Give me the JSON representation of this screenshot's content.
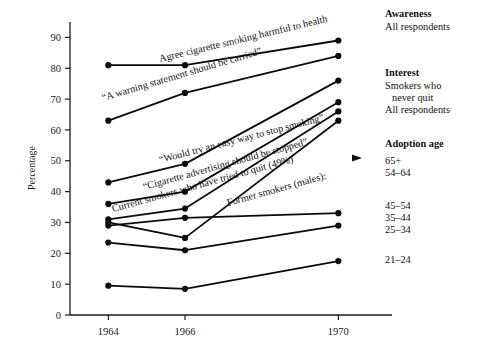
{
  "chart_data": {
    "type": "line",
    "title": "",
    "xlabel": "",
    "ylabel": "Percentage",
    "x": [
      1964,
      1966,
      1970
    ],
    "xtick_labels": [
      "1964",
      "1966",
      "1970"
    ],
    "ylim": [
      0,
      95
    ],
    "yticks": [
      0,
      10,
      20,
      30,
      40,
      50,
      60,
      70,
      80,
      90
    ],
    "ytick_labels": [
      "0",
      "10",
      "20",
      "30",
      "40",
      "50",
      "60",
      "70",
      "80",
      "90"
    ],
    "grid": false,
    "legend_position": "right",
    "marker": "filled-circle",
    "series": [
      {
        "name": "Awareness - All respondents",
        "label": "Agree cigarette smoking harmful to health",
        "values": [
          81,
          81,
          89
        ]
      },
      {
        "name": "Interest - Smokers who never quit",
        "label": "“A warning statement should be carried”",
        "values": [
          63,
          72,
          84
        ]
      },
      {
        "name": "Interest - All respondents",
        "label": "“Would try an easy way to stop smoking”",
        "values": [
          43,
          49,
          76
        ]
      },
      {
        "name": "Adoption age 65+",
        "label": "“Cigarette advertising should be stopped”",
        "values": [
          36,
          40,
          69
        ]
      },
      {
        "name": "Adoption age 54-64",
        "label": "Current smokers who have tried to quit (49%)",
        "values": [
          31,
          34.5,
          66
        ]
      },
      {
        "name": "Adoption age 45-54",
        "label": "Former smokers (males):",
        "values": [
          30,
          25,
          63
        ]
      },
      {
        "name": "Adoption age 35-44",
        "label": "",
        "values": [
          29,
          31.5,
          33
        ]
      },
      {
        "name": "Adoption age 25-34",
        "label": "",
        "values": [
          23.5,
          21,
          29
        ]
      },
      {
        "name": "Adoption age 21-24",
        "label": "",
        "values": [
          9.5,
          8.5,
          17.5
        ]
      }
    ],
    "annotations": [
      {
        "text": "Agree cigarette smoking harmful to health"
      },
      {
        "text": "“A warning statement should be carried”"
      },
      {
        "text": "“Would try an easy way to stop smoking”"
      },
      {
        "text": "“Cigarette advertising should be stopped”"
      },
      {
        "text": "Current smokers who have tried to quit (49%)"
      },
      {
        "text": "Former smokers (males):"
      }
    ]
  },
  "axis": {
    "ylabel": "Percentage",
    "yticks": [
      "90",
      "80",
      "70",
      "60",
      "50",
      "40",
      "30",
      "20",
      "10",
      "0"
    ],
    "xticks": [
      "1964",
      "1966",
      "1970"
    ]
  },
  "inline_labels": {
    "awareness": "Agree cigarette smoking harmful to health",
    "warning": "“A warning statement should be carried”",
    "easy_way": "“Would try an easy way to stop smoking”",
    "advertising": "“Cigarette advertising should be stopped”",
    "tried_quit": "Current smokers who have tried to quit (49%)",
    "former_smokers": "Former smokers (males):"
  },
  "legend": {
    "groups": [
      {
        "heading": "Awareness",
        "items": [
          "All respondents"
        ]
      },
      {
        "heading": "Interest",
        "items": [
          "Smokers who",
          "never quit",
          "All respondents"
        ]
      },
      {
        "heading": "Adoption age",
        "items": [
          "65+",
          "54–64",
          "45–54",
          "35–44",
          "25–34",
          "21–24"
        ]
      }
    ],
    "awareness_heading": "Awareness",
    "awareness_item_1": "All respondents",
    "interest_heading": "Interest",
    "interest_item_1": "Smokers who",
    "interest_item_2": "never quit",
    "interest_item_3": "All respondents",
    "adoption_heading": "Adoption age",
    "adoption_item_1": "65+",
    "adoption_item_2": "54–64",
    "adoption_item_3": "45–54",
    "adoption_item_4": "35–44",
    "adoption_item_5": "25–34",
    "adoption_item_6": "21–24"
  },
  "colors": {
    "line": "#0b0b0b",
    "axis": "#1a1a1a",
    "background": "#ffffff"
  }
}
